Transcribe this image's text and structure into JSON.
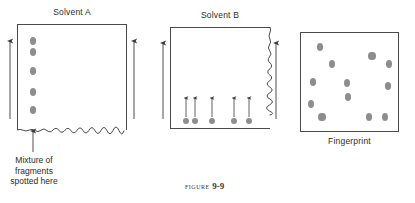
{
  "figure": {
    "caption_label": "FIGURE",
    "caption_number": "9-9"
  },
  "panels": [
    {
      "id": "solvent-a",
      "title": "Solvent A",
      "caption": "",
      "plate": {
        "x": 17,
        "y": 24,
        "w": 110,
        "h": 106
      },
      "edge_style": "wavy-bottom",
      "flow_arrows": [
        {
          "x": 10,
          "y_top": 41,
          "y_bottom": 119
        },
        {
          "x": 134,
          "y_top": 41,
          "y_bottom": 119
        }
      ],
      "spots": [
        {
          "cx": 33,
          "cy": 41,
          "rx": 3.2,
          "ry": 4.0
        },
        {
          "cx": 33,
          "cy": 52,
          "rx": 3.2,
          "ry": 4.0
        },
        {
          "cx": 33,
          "cy": 71,
          "rx": 3.2,
          "ry": 4.0
        },
        {
          "cx": 33,
          "cy": 92,
          "rx": 3.2,
          "ry": 4.0
        },
        {
          "cx": 33,
          "cy": 110,
          "rx": 3.2,
          "ry": 4.0
        }
      ],
      "pointer_arrow": {
        "x": 33,
        "y_bottom": 152,
        "y_top": 131
      },
      "annotation_lines": [
        "Mixture of",
        "fragments",
        "spotted here"
      ]
    },
    {
      "id": "solvent-b",
      "title": "Solvent B",
      "caption": "",
      "plate": {
        "x": 170,
        "y": 27,
        "w": 100,
        "h": 102
      },
      "edge_style": "wavy-right",
      "flow_arrows": [
        {
          "x": 163,
          "y_top": 43,
          "y_bottom": 119
        },
        {
          "x": 276,
          "y_top": 43,
          "y_bottom": 119
        }
      ],
      "spots": [
        {
          "cx": 186,
          "cy": 121,
          "rx": 3.4,
          "ry": 3.4
        },
        {
          "cx": 195,
          "cy": 121,
          "rx": 3.4,
          "ry": 3.4
        },
        {
          "cx": 212,
          "cy": 121,
          "rx": 3.4,
          "ry": 3.4
        },
        {
          "cx": 234,
          "cy": 121,
          "rx": 3.4,
          "ry": 3.4
        },
        {
          "cx": 249,
          "cy": 121,
          "rx": 3.4,
          "ry": 3.4
        }
      ],
      "migration_arrows": [
        {
          "x": 186,
          "y_bottom": 117,
          "y_top": 98
        },
        {
          "x": 195,
          "y_bottom": 117,
          "y_top": 98
        },
        {
          "x": 212,
          "y_bottom": 117,
          "y_top": 98
        },
        {
          "x": 234,
          "y_bottom": 117,
          "y_top": 98
        },
        {
          "x": 249,
          "y_bottom": 117,
          "y_top": 98
        }
      ]
    },
    {
      "id": "fingerprint",
      "title": "",
      "caption": "Fingerprint",
      "plate": {
        "x": 300,
        "y": 32,
        "w": 99,
        "h": 100
      },
      "edge_style": "plain",
      "flow_arrows": [],
      "spots": [
        {
          "cx": 320,
          "cy": 47,
          "rx": 3.2,
          "ry": 4.0
        },
        {
          "cx": 332,
          "cy": 64,
          "rx": 3.4,
          "ry": 4.4
        },
        {
          "cx": 313,
          "cy": 82,
          "rx": 3.2,
          "ry": 4.0
        },
        {
          "cx": 347,
          "cy": 83,
          "rx": 3.4,
          "ry": 4.4
        },
        {
          "cx": 348,
          "cy": 97,
          "rx": 3.2,
          "ry": 4.0
        },
        {
          "cx": 311,
          "cy": 104,
          "rx": 3.2,
          "ry": 4.2
        },
        {
          "cx": 322,
          "cy": 117,
          "rx": 3.6,
          "ry": 4.4
        },
        {
          "cx": 372,
          "cy": 56,
          "rx": 3.6,
          "ry": 4.4
        },
        {
          "cx": 389,
          "cy": 64,
          "rx": 3.4,
          "ry": 4.2
        },
        {
          "cx": 388,
          "cy": 86,
          "rx": 3.2,
          "ry": 4.0
        },
        {
          "cx": 369,
          "cy": 117,
          "rx": 3.4,
          "ry": 4.2
        },
        {
          "cx": 385,
          "cy": 117,
          "rx": 3.2,
          "ry": 4.2
        }
      ],
      "migration_arrows": []
    }
  ],
  "colors": {
    "spot_fill": "#8d8d8d",
    "plate_border": "#4a4a4a",
    "arrow": "#3a3a3a",
    "text": "#2b2b2b"
  }
}
